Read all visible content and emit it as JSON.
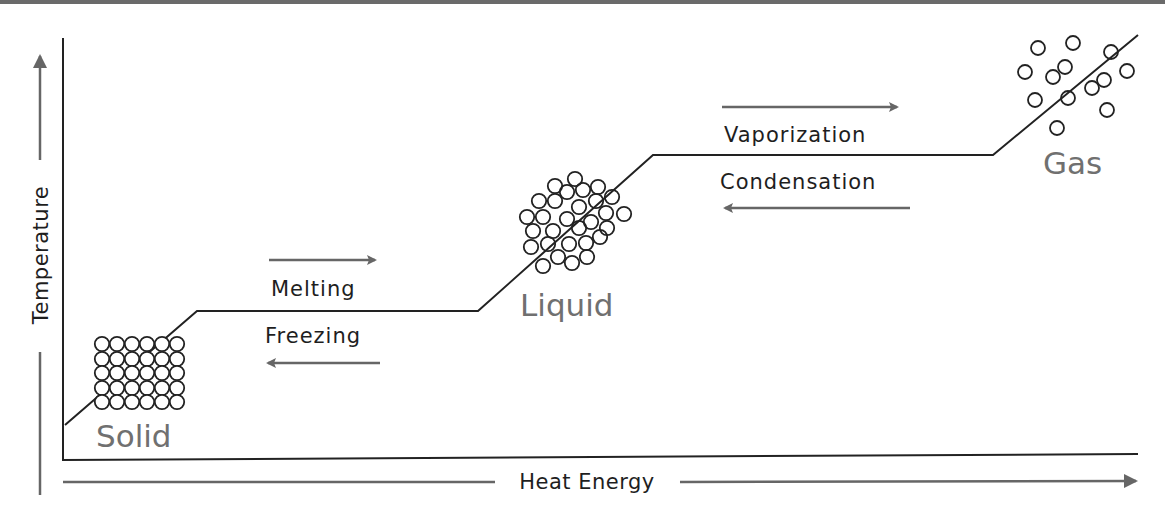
{
  "diagram": {
    "axes": {
      "x_label": "Heat Energy",
      "y_label": "Temperature"
    },
    "phases": [
      {
        "name": "solid",
        "label": "Solid"
      },
      {
        "name": "liquid",
        "label": "Liquid"
      },
      {
        "name": "gas",
        "label": "Gas"
      }
    ],
    "transitions": [
      {
        "forward": "Melting",
        "reverse": "Freezing",
        "between": [
          "Solid",
          "Liquid"
        ]
      },
      {
        "forward": "Vaporization",
        "reverse": "Condensation",
        "between": [
          "Liquid",
          "Gas"
        ]
      }
    ],
    "curve_points": [
      [
        65,
        425
      ],
      [
        197,
        311
      ],
      [
        478,
        311
      ],
      [
        653,
        155
      ],
      [
        993,
        155
      ],
      [
        1138,
        35
      ]
    ],
    "colors": {
      "line": "#222222",
      "arrow": "#666666",
      "phase_label": "#707070",
      "text": "#1e1e1e",
      "top_band": "#6a6a6a"
    }
  }
}
